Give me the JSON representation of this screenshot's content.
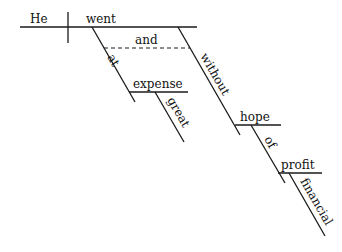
{
  "diagram": {
    "type": "sentence-diagram",
    "sentence": "He went at great expense and without hope of financial profit",
    "words": {
      "subject": "He",
      "verb": "went",
      "conjunction": "and",
      "prep1": "at",
      "obj1": "expense",
      "mod1": "great",
      "prep2": "without",
      "obj2": "hope",
      "prep3": "of",
      "obj3": "profit",
      "mod3": "financial"
    }
  }
}
